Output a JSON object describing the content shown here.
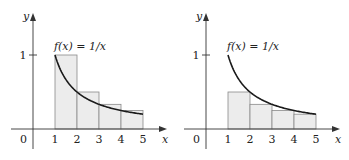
{
  "figure": {
    "panels": [
      {
        "id": "left",
        "function_label": "f(x) = 1/x",
        "approximation": "left-endpoint rectangles (overestimate)",
        "axis_labels": {
          "x": "x",
          "y": "y"
        },
        "x_ticks": [
          "1",
          "2",
          "3",
          "4",
          "5"
        ],
        "y_ticks": [
          "1"
        ],
        "origin_label": "0",
        "rectangles": [
          {
            "x0": 1,
            "x1": 2,
            "height": 1.0
          },
          {
            "x0": 2,
            "x1": 3,
            "height": 0.5
          },
          {
            "x0": 3,
            "x1": 4,
            "height": 0.3333
          },
          {
            "x0": 4,
            "x1": 5,
            "height": 0.25
          }
        ]
      },
      {
        "id": "right",
        "function_label": "f(x) = 1/x",
        "approximation": "right-endpoint rectangles (underestimate)",
        "axis_labels": {
          "x": "x",
          "y": "y"
        },
        "x_ticks": [
          "1",
          "2",
          "3",
          "4",
          "5"
        ],
        "y_ticks": [
          "1"
        ],
        "origin_label": "0",
        "rectangles": [
          {
            "x0": 1,
            "x1": 2,
            "height": 0.5
          },
          {
            "x0": 2,
            "x1": 3,
            "height": 0.3333
          },
          {
            "x0": 3,
            "x1": 4,
            "height": 0.25
          },
          {
            "x0": 4,
            "x1": 5,
            "height": 0.2
          }
        ]
      }
    ],
    "colors": {
      "rect_fill": "#ececec",
      "rect_stroke": "#8a8a8a",
      "curve": "#1a1a1a",
      "axis": "#333333"
    }
  }
}
